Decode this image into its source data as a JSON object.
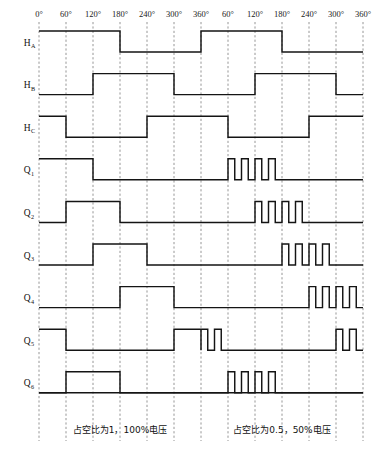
{
  "figure": {
    "title_hidden": "",
    "axis": {
      "tick_labels": [
        "0°",
        "60°",
        "120°",
        "180°",
        "240°",
        "300°",
        "360°",
        "60°",
        "120°",
        "180°",
        "240°",
        "300°",
        "360°"
      ],
      "tick_degrees": [
        0,
        60,
        120,
        180,
        240,
        300,
        360,
        420,
        480,
        540,
        600,
        660,
        720
      ],
      "x_min_deg": 0,
      "x_max_deg": 720,
      "grid": true,
      "grid_color": "#8a8a8a",
      "wave_color": "#141414"
    },
    "captions": [
      {
        "text": "占空比为1，100%电压",
        "center_deg": 180
      },
      {
        "text": "占空比为0.5，50%电压",
        "center_deg": 540
      }
    ],
    "signals": [
      {
        "name": "H",
        "sub": "A",
        "label_full": "H_A",
        "segments": [
          {
            "start_deg": 0,
            "end_deg": 180,
            "level": 1,
            "mode": "solid"
          },
          {
            "start_deg": 180,
            "end_deg": 360,
            "level": 0,
            "mode": "solid"
          },
          {
            "start_deg": 360,
            "end_deg": 540,
            "level": 1,
            "mode": "solid"
          },
          {
            "start_deg": 540,
            "end_deg": 720,
            "level": 0,
            "mode": "solid"
          }
        ]
      },
      {
        "name": "H",
        "sub": "B",
        "label_full": "H_B",
        "segments": [
          {
            "start_deg": 0,
            "end_deg": 120,
            "level": 0,
            "mode": "solid"
          },
          {
            "start_deg": 120,
            "end_deg": 300,
            "level": 1,
            "mode": "solid"
          },
          {
            "start_deg": 300,
            "end_deg": 480,
            "level": 0,
            "mode": "solid"
          },
          {
            "start_deg": 480,
            "end_deg": 660,
            "level": 1,
            "mode": "solid"
          },
          {
            "start_deg": 660,
            "end_deg": 720,
            "level": 0,
            "mode": "solid"
          }
        ]
      },
      {
        "name": "H",
        "sub": "C",
        "label_full": "H_C",
        "segments": [
          {
            "start_deg": 0,
            "end_deg": 60,
            "level": 1,
            "mode": "solid"
          },
          {
            "start_deg": 60,
            "end_deg": 240,
            "level": 0,
            "mode": "solid"
          },
          {
            "start_deg": 240,
            "end_deg": 420,
            "level": 1,
            "mode": "solid"
          },
          {
            "start_deg": 420,
            "end_deg": 600,
            "level": 0,
            "mode": "solid"
          },
          {
            "start_deg": 600,
            "end_deg": 720,
            "level": 1,
            "mode": "solid"
          }
        ]
      },
      {
        "name": "Q",
        "sub": "1",
        "label_full": "Q_1",
        "segments": [
          {
            "start_deg": 0,
            "end_deg": 120,
            "level": 1,
            "mode": "solid"
          },
          {
            "start_deg": 120,
            "end_deg": 420,
            "level": 0,
            "mode": "solid"
          },
          {
            "start_deg": 420,
            "end_deg": 540,
            "level": 1,
            "mode": "pwm",
            "pulses": 4,
            "duty": 0.5
          },
          {
            "start_deg": 540,
            "end_deg": 720,
            "level": 0,
            "mode": "solid"
          }
        ]
      },
      {
        "name": "Q",
        "sub": "2",
        "label_full": "Q_2",
        "segments": [
          {
            "start_deg": 0,
            "end_deg": 60,
            "level": 0,
            "mode": "solid"
          },
          {
            "start_deg": 60,
            "end_deg": 180,
            "level": 1,
            "mode": "solid"
          },
          {
            "start_deg": 180,
            "end_deg": 480,
            "level": 0,
            "mode": "solid"
          },
          {
            "start_deg": 480,
            "end_deg": 600,
            "level": 1,
            "mode": "pwm",
            "pulses": 4,
            "duty": 0.5
          },
          {
            "start_deg": 600,
            "end_deg": 720,
            "level": 0,
            "mode": "solid"
          }
        ]
      },
      {
        "name": "Q",
        "sub": "3",
        "label_full": "Q_3",
        "segments": [
          {
            "start_deg": 0,
            "end_deg": 120,
            "level": 0,
            "mode": "solid"
          },
          {
            "start_deg": 120,
            "end_deg": 240,
            "level": 1,
            "mode": "solid"
          },
          {
            "start_deg": 240,
            "end_deg": 540,
            "level": 0,
            "mode": "solid"
          },
          {
            "start_deg": 540,
            "end_deg": 660,
            "level": 1,
            "mode": "pwm",
            "pulses": 4,
            "duty": 0.5
          },
          {
            "start_deg": 660,
            "end_deg": 720,
            "level": 0,
            "mode": "solid"
          }
        ]
      },
      {
        "name": "Q",
        "sub": "4",
        "label_full": "Q_4",
        "segments": [
          {
            "start_deg": 0,
            "end_deg": 180,
            "level": 0,
            "mode": "solid"
          },
          {
            "start_deg": 180,
            "end_deg": 300,
            "level": 1,
            "mode": "solid"
          },
          {
            "start_deg": 300,
            "end_deg": 600,
            "level": 0,
            "mode": "solid"
          },
          {
            "start_deg": 600,
            "end_deg": 720,
            "level": 1,
            "mode": "pwm",
            "pulses": 4,
            "duty": 0.5
          }
        ]
      },
      {
        "name": "Q",
        "sub": "5",
        "label_full": "Q_5",
        "segments": [
          {
            "start_deg": 0,
            "end_deg": 60,
            "level": 1,
            "mode": "solid"
          },
          {
            "start_deg": 60,
            "end_deg": 300,
            "level": 0,
            "mode": "solid"
          },
          {
            "start_deg": 300,
            "end_deg": 360,
            "level": 1,
            "mode": "solid"
          },
          {
            "start_deg": 360,
            "end_deg": 420,
            "level": 1,
            "mode": "pwm",
            "pulses": 2,
            "duty": 0.5
          },
          {
            "start_deg": 420,
            "end_deg": 660,
            "level": 0,
            "mode": "solid"
          },
          {
            "start_deg": 660,
            "end_deg": 720,
            "level": 1,
            "mode": "pwm",
            "pulses": 2,
            "duty": 0.5
          }
        ]
      },
      {
        "name": "Q",
        "sub": "6",
        "label_full": "Q_6",
        "segments": [
          {
            "start_deg": 0,
            "end_deg": 60,
            "level": 0,
            "mode": "solid"
          },
          {
            "start_deg": 60,
            "end_deg": 180,
            "level": 1,
            "mode": "solid"
          },
          {
            "start_deg": 180,
            "end_deg": 420,
            "level": 0,
            "mode": "solid"
          },
          {
            "start_deg": 420,
            "end_deg": 540,
            "level": 1,
            "mode": "pwm",
            "pulses": 4,
            "duty": 0.5
          },
          {
            "start_deg": 540,
            "end_deg": 720,
            "level": 0,
            "mode": "solid"
          }
        ]
      }
    ]
  },
  "chart_data": {
    "type": "line",
    "xlabel": "",
    "ylabel": "",
    "xlim": [
      0,
      720
    ],
    "grid": true,
    "legend_position": "none",
    "x_tick_labels": [
      "0°",
      "60°",
      "120°",
      "180°",
      "240°",
      "300°",
      "360°",
      "60°",
      "120°",
      "180°",
      "240°",
      "300°",
      "360°"
    ],
    "x_ticks": [
      0,
      60,
      120,
      180,
      240,
      300,
      360,
      420,
      480,
      540,
      600,
      660,
      720
    ],
    "annotations": [
      "占空比为1，100%电压",
      "占空比为0.5，50%电压"
    ],
    "series": [
      {
        "name": "H_A",
        "high_intervals_deg": [
          [
            0,
            180
          ],
          [
            360,
            540
          ]
        ],
        "pwm_intervals_deg": []
      },
      {
        "name": "H_B",
        "high_intervals_deg": [
          [
            120,
            300
          ],
          [
            480,
            660
          ]
        ],
        "pwm_intervals_deg": []
      },
      {
        "name": "H_C",
        "high_intervals_deg": [
          [
            0,
            60
          ],
          [
            240,
            420
          ],
          [
            600,
            720
          ]
        ],
        "pwm_intervals_deg": []
      },
      {
        "name": "Q_1",
        "high_intervals_deg": [
          [
            0,
            120
          ]
        ],
        "pwm_intervals_deg": [
          [
            420,
            540
          ]
        ],
        "pwm_pulses": 4,
        "pwm_duty": 0.5
      },
      {
        "name": "Q_2",
        "high_intervals_deg": [
          [
            60,
            180
          ]
        ],
        "pwm_intervals_deg": [
          [
            480,
            600
          ]
        ],
        "pwm_pulses": 4,
        "pwm_duty": 0.5
      },
      {
        "name": "Q_3",
        "high_intervals_deg": [
          [
            120,
            240
          ]
        ],
        "pwm_intervals_deg": [
          [
            540,
            660
          ]
        ],
        "pwm_pulses": 4,
        "pwm_duty": 0.5
      },
      {
        "name": "Q_4",
        "high_intervals_deg": [
          [
            180,
            300
          ]
        ],
        "pwm_intervals_deg": [
          [
            600,
            720
          ]
        ],
        "pwm_pulses": 4,
        "pwm_duty": 0.5
      },
      {
        "name": "Q_5",
        "high_intervals_deg": [
          [
            0,
            60
          ],
          [
            300,
            360
          ]
        ],
        "pwm_intervals_deg": [
          [
            360,
            420
          ],
          [
            660,
            720
          ]
        ],
        "pwm_pulses": 2,
        "pwm_duty": 0.5
      },
      {
        "name": "Q_6",
        "high_intervals_deg": [
          [
            60,
            180
          ]
        ],
        "pwm_intervals_deg": [
          [
            420,
            540
          ]
        ],
        "pwm_pulses": 4,
        "pwm_duty": 0.5
      }
    ]
  }
}
